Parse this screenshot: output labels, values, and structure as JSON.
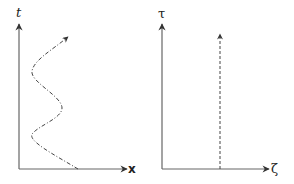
{
  "panels": [
    {
      "id": "left",
      "y_axis_label": "t",
      "x_axis_label": "x",
      "curve": "dash-dot oscillating worldline with arrow"
    },
    {
      "id": "right",
      "y_axis_label": "τ",
      "x_axis_label": "ζ",
      "curve": "dashed vertical worldline with arrow"
    }
  ],
  "colors": {
    "axis": "#555555",
    "curve": "#444444"
  }
}
